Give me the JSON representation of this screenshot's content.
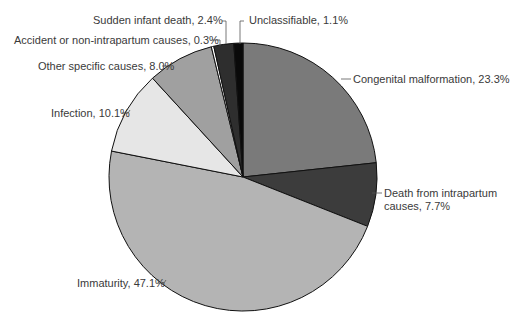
{
  "chart_data": {
    "type": "pie",
    "title": "",
    "start_angle_deg": 0,
    "direction": "clockwise",
    "slices": [
      {
        "label": "Congenital malformation",
        "value": 23.3,
        "color": "#7a7a7a",
        "text": "Congenital malformation, 23.3%"
      },
      {
        "label": "Death from intrapartum causes",
        "value": 7.7,
        "color": "#3c3c3c",
        "text": "Death from intrapartum causes, 7.7%"
      },
      {
        "label": "Immaturity",
        "value": 47.1,
        "color": "#b4b4b4",
        "text": "Immaturity, 47.1%"
      },
      {
        "label": "Infection",
        "value": 10.1,
        "color": "#e6e6e6",
        "text": "Infection, 10.1%"
      },
      {
        "label": "Other specific causes",
        "value": 8.0,
        "color": "#a0a0a0",
        "text": "Other specific causes, 8.0%"
      },
      {
        "label": "Accident or non-intrapartum causes",
        "value": 0.3,
        "color": "#ffffff",
        "text": "Accident or non-intrapartum causes, 0.3%"
      },
      {
        "label": "Sudden infant death",
        "value": 2.4,
        "color": "#2e2e2e",
        "text": "Sudden infant death, 2.4%"
      },
      {
        "label": "Unclassifiable",
        "value": 1.1,
        "color": "#0a0a0a",
        "text": "Unclassifiable, 1.1%"
      }
    ]
  },
  "labels": {
    "congenital": "Congenital malformation, 23.3%",
    "intrapartum_1": "Death from intrapartum",
    "intrapartum_2": "causes, 7.7%",
    "immaturity": "Immaturity, 47.1%",
    "infection": "Infection, 10.1%",
    "other": "Other specific causes, 8.0%",
    "accident": "Accident or non-intrapartum causes, 0.3%",
    "sids": "Sudden infant death, 2.4%",
    "unclassifiable": "Unclassifiable, 1.1%"
  }
}
